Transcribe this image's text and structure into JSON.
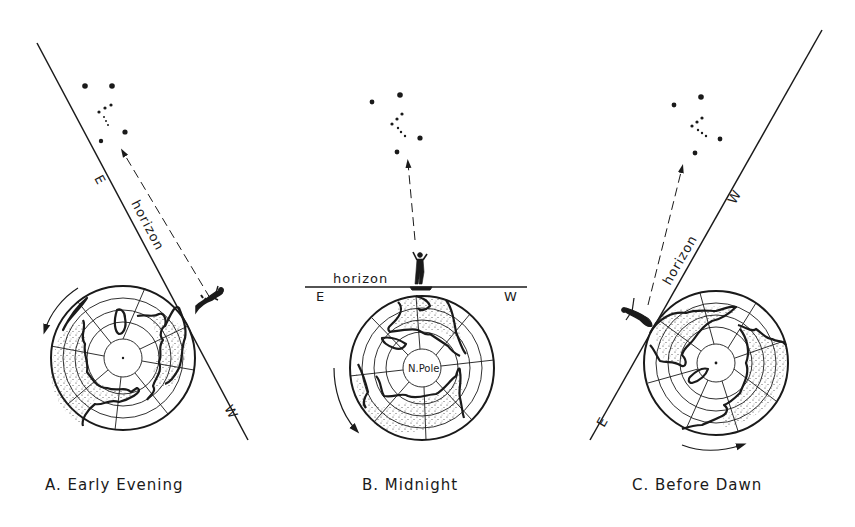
{
  "figure": {
    "panels": [
      {
        "id": "A",
        "caption": "A. Early Evening",
        "horizon_label": "horizon",
        "east_label": "E",
        "west_label": "W",
        "rotation_direction": "counterclockwise"
      },
      {
        "id": "B",
        "caption": "B. Midnight",
        "horizon_label": "horizon",
        "east_label": "E",
        "west_label": "W",
        "pole_label": "N.Pole",
        "rotation_direction": "counterclockwise"
      },
      {
        "id": "C",
        "caption": "C. Before Dawn",
        "horizon_label": "horizon",
        "east_label": "E",
        "west_label": "W",
        "rotation_direction": "counterclockwise"
      }
    ],
    "colors": {
      "ink": "#1a1a1a",
      "background": "#ffffff"
    }
  }
}
